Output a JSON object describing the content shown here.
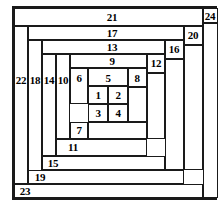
{
  "figure": {
    "type": "squared-rectangle-dissection",
    "title": "",
    "width": 219,
    "height": 203,
    "stroke_color": "#1a1a1a",
    "background_color": "#ffffff",
    "label_color": "#000000",
    "count": 24
  },
  "cells": [
    {
      "id": "1",
      "label": "1",
      "x": 88,
      "y": 86,
      "w": 20,
      "h": 18
    },
    {
      "id": "2",
      "label": "2",
      "x": 108,
      "y": 86,
      "w": 20,
      "h": 18
    },
    {
      "id": "3",
      "label": "3",
      "x": 88,
      "y": 104,
      "w": 20,
      "h": 18
    },
    {
      "id": "4",
      "label": "4",
      "x": 108,
      "y": 104,
      "w": 20,
      "h": 18
    },
    {
      "id": "5",
      "label": "5",
      "x": 88,
      "y": 68,
      "w": 40,
      "h": 18
    },
    {
      "id": "6",
      "label": "6",
      "x": 70,
      "y": 68,
      "w": 18,
      "h": 36
    },
    {
      "id": "7",
      "label": "7",
      "x": 70,
      "y": 122,
      "w": 18,
      "h": 17
    },
    {
      "id": "8",
      "label": "8",
      "x": 128,
      "y": 68,
      "w": 19,
      "h": 19
    },
    {
      "id": "9",
      "label": "9",
      "x": 70,
      "y": 54,
      "w": 77,
      "h": 14
    },
    {
      "id": "10",
      "label": "10",
      "x": 56,
      "y": 54,
      "w": 14,
      "h": 85
    },
    {
      "id": "11",
      "label": "11",
      "x": 56,
      "y": 139,
      "w": 91,
      "h": 17
    },
    {
      "id": "12",
      "label": "12",
      "x": 147,
      "y": 54,
      "w": 18,
      "h": 19
    },
    {
      "id": "13",
      "label": "13",
      "x": 42,
      "y": 40,
      "w": 123,
      "h": 14
    },
    {
      "id": "14",
      "label": "14",
      "x": 42,
      "y": 54,
      "w": 14,
      "h": 102
    },
    {
      "id": "15",
      "label": "15",
      "x": 42,
      "y": 156,
      "w": 123,
      "h": 14
    },
    {
      "id": "16",
      "label": "16",
      "x": 165,
      "y": 40,
      "w": 19,
      "h": 19
    },
    {
      "id": "17",
      "label": "17",
      "x": 28,
      "y": 26,
      "w": 156,
      "h": 14
    },
    {
      "id": "18",
      "label": "18",
      "x": 28,
      "y": 40,
      "w": 14,
      "h": 144
    },
    {
      "id": "19",
      "label": "19",
      "x": 28,
      "y": 170,
      "w": 156,
      "h": 14
    },
    {
      "id": "20",
      "label": "20",
      "x": 184,
      "y": 26,
      "w": 19,
      "h": 19
    },
    {
      "id": "21",
      "label": "21",
      "x": 14,
      "y": 8,
      "w": 189,
      "h": 18
    },
    {
      "id": "22",
      "label": "22",
      "x": 14,
      "y": 26,
      "w": 14,
      "h": 158
    },
    {
      "id": "23",
      "label": "23",
      "x": 14,
      "y": 184,
      "w": 189,
      "h": 14
    },
    {
      "id": "24",
      "label": "24",
      "x": 203,
      "y": 8,
      "w": 15,
      "h": 15
    }
  ],
  "extra_cells": [
    {
      "id": "r-inner-bottom",
      "x": 88,
      "y": 122,
      "w": 59,
      "h": 17
    },
    {
      "id": "r-right-col",
      "x": 147,
      "y": 73,
      "w": 18,
      "h": 66
    },
    {
      "id": "r-8-below",
      "x": 128,
      "y": 87,
      "w": 19,
      "h": 35
    },
    {
      "id": "r-20-below",
      "x": 184,
      "y": 45,
      "w": 19,
      "h": 125
    },
    {
      "id": "r-16-below",
      "x": 165,
      "y": 59,
      "w": 19,
      "h": 111
    },
    {
      "id": "r-24-below",
      "x": 203,
      "y": 23,
      "w": 15,
      "h": 175
    }
  ],
  "labels": [
    {
      "text": "1",
      "cx": 98,
      "cy": 95
    },
    {
      "text": "2",
      "cx": 118,
      "cy": 95
    },
    {
      "text": "3",
      "cx": 98,
      "cy": 113
    },
    {
      "text": "4",
      "cx": 118,
      "cy": 113
    },
    {
      "text": "5",
      "cx": 108,
      "cy": 78
    },
    {
      "text": "6",
      "cx": 79,
      "cy": 78
    },
    {
      "text": "7",
      "cx": 79,
      "cy": 130
    },
    {
      "text": "8",
      "cx": 137,
      "cy": 78
    },
    {
      "text": "9",
      "cx": 112,
      "cy": 61
    },
    {
      "text": "10",
      "cx": 63,
      "cy": 80
    },
    {
      "text": "11",
      "cx": 73,
      "cy": 147
    },
    {
      "text": "12",
      "cx": 156,
      "cy": 63
    },
    {
      "text": "13",
      "cx": 112,
      "cy": 47
    },
    {
      "text": "14",
      "cx": 49,
      "cy": 80
    },
    {
      "text": "15",
      "cx": 53,
      "cy": 163
    },
    {
      "text": "16",
      "cx": 174,
      "cy": 49
    },
    {
      "text": "17",
      "cx": 112,
      "cy": 33
    },
    {
      "text": "18",
      "cx": 35,
      "cy": 80
    },
    {
      "text": "19",
      "cx": 40,
      "cy": 177
    },
    {
      "text": "20",
      "cx": 193,
      "cy": 35
    },
    {
      "text": "21",
      "cx": 112,
      "cy": 17
    },
    {
      "text": "22",
      "cx": 21,
      "cy": 80
    },
    {
      "text": "23",
      "cx": 25,
      "cy": 191
    },
    {
      "text": "24",
      "cx": 210,
      "cy": 16
    }
  ]
}
